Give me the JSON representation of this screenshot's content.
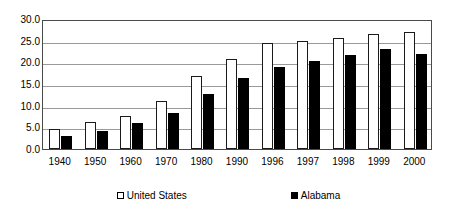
{
  "chart_data": {
    "type": "bar",
    "title": "",
    "subtitle": "",
    "xlabel": "",
    "ylabel": "",
    "categories": [
      "1940",
      "1950",
      "1960",
      "1970",
      "1980",
      "1990",
      "1996",
      "1997",
      "1998",
      "1999",
      "2000"
    ],
    "series": [
      {
        "name": "United States",
        "color": "#ffffff",
        "edge_color": "#000000",
        "values": [
          4.6,
          6.2,
          7.7,
          11.0,
          16.9,
          20.8,
          24.4,
          24.9,
          25.6,
          26.5,
          27.0
        ]
      },
      {
        "name": "Alabama",
        "color": "#000000",
        "edge_color": "#000000",
        "values": [
          3.0,
          4.1,
          6.1,
          8.4,
          12.6,
          16.3,
          19.0,
          20.2,
          21.6,
          23.0,
          22.0
        ]
      }
    ],
    "ylim": [
      0.0,
      30.0
    ],
    "ytick_labels": [
      "30.0",
      "25.0",
      "20.0",
      "15.0",
      "10.0",
      "5.0",
      "0.0"
    ],
    "ytick_values": [
      30.0,
      25.0,
      20.0,
      15.0,
      10.0,
      5.0,
      0.0
    ],
    "grid": true,
    "grid_axis": "y",
    "legend_position": "bottom",
    "legend_entries": [
      {
        "label": "United States",
        "swatch": "hollow-square"
      },
      {
        "label": "Alabama",
        "swatch": "filled-square"
      }
    ],
    "plot_background": "#ffffff",
    "frame_color": "#4a4a4a",
    "gridline_color": "#9a9a9a"
  }
}
